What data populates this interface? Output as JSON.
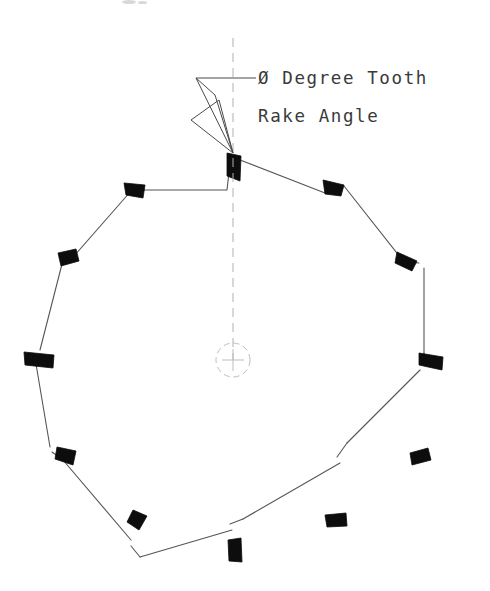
{
  "drawing": {
    "title": "Circular Saw Blade Tooth Rake Angle",
    "background_color": "#ffffff",
    "ink_color": "#1a1a1a",
    "line_color": "#555555",
    "centerline_color": "#b0b0b0",
    "tip_fill_color": "#0d0d0d",
    "annotation": {
      "line1": "Ø Degree Tooth",
      "line2": "Rake Angle",
      "line1_x": 258,
      "line1_y": 84,
      "line2_x": 258,
      "line2_y": 122,
      "text_color": "#3a3a3a"
    },
    "leader": {
      "name": "rake-angle-leader",
      "horizontal_start_x": 196,
      "horizontal_end_x": 256,
      "horizontal_y": 78,
      "arrow_tip_x": 233,
      "arrow_tip_y": 153,
      "triangle_upper": "196,78 233,153 215,95",
      "triangle_lower": "191,120 233,153 219,100"
    },
    "centerline": {
      "name": "vertical-centerline",
      "x": 233,
      "y_top": 38,
      "y_bottom": 360,
      "dash_pattern": "9 6",
      "width": 1
    },
    "hub": {
      "name": "arbor-center-mark",
      "cx": 233,
      "cy": 360,
      "radius": 17,
      "cross_len": 11,
      "dash_pattern": "6 4"
    },
    "blade": {
      "name": "saw-blade-outline",
      "tooth_count": 12,
      "body_path": "M 233,158 L 324,192 L 337,185 L 404,262 L 403,271 L 443,363 L 434,365 L 420,462 L 412,462 L 347,524 L 340,521 L 241,557 L 235,553 L 140,522 L 137,515 L 62,459 L 62,452 L 36,363 L 44,358 L 61,263 L 69,263 L 131,190 L 138,193 Z",
      "outline_segments": [
        {
          "name": "gullet-top",
          "d": "M 140,190 L 227,190 L 229,172"
        },
        {
          "name": "back-slope-1",
          "d": "M 240,160 L 325,193"
        },
        {
          "name": "gullet-1",
          "d": "M 325,193 L 337,186"
        },
        {
          "name": "back-slope-2",
          "d": "M 344,186 L 404,262"
        },
        {
          "name": "gullet-2",
          "d": "M 404,262 L 419,263"
        },
        {
          "name": "back-slope-3",
          "d": "M 424,268 L 424,353"
        },
        {
          "name": "gullet-3",
          "d": "M 424,353 L 424,362"
        },
        {
          "name": "back-slope-4",
          "d": "M 420,370 L 347,443"
        },
        {
          "name": "gullet-4",
          "d": "M 347,443 L 337,457"
        },
        {
          "name": "back-slope-5",
          "d": "M 340,463 L 243,519"
        },
        {
          "name": "gullet-5",
          "d": "M 243,519 L 230,524"
        },
        {
          "name": "back-slope-6",
          "d": "M 232,530 L 140,557"
        },
        {
          "name": "gullet-6",
          "d": "M 140,557 L 131,546"
        },
        {
          "name": "back-slope-7",
          "d": "M 131,540 L 63,460"
        },
        {
          "name": "gullet-7",
          "d": "M 63,460 L 52,452"
        },
        {
          "name": "back-slope-8",
          "d": "M 50,447 L 36,364"
        },
        {
          "name": "gullet-8",
          "d": "M 36,364 L 36,355"
        },
        {
          "name": "back-slope-9",
          "d": "M 40,350 L 62,264"
        },
        {
          "name": "gullet-9",
          "d": "M 62,264 L 70,257"
        },
        {
          "name": "back-slope-10",
          "d": "M 74,256 L 131,191"
        }
      ],
      "teeth": [
        {
          "index": 1,
          "name": "tooth-carbide-tip",
          "position": "top",
          "points": "227,153 241,156 240,181 227,176",
          "tip_x": 233,
          "tip_y": 155
        },
        {
          "index": 2,
          "name": "tooth-carbide-tip",
          "position": "upper-right-1",
          "points": "323,180 344,185 341,196 325,194",
          "tip_x": 333,
          "tip_y": 186
        },
        {
          "index": 3,
          "name": "tooth-carbide-tip",
          "position": "upper-right-2",
          "points": "397,252 417,261 412,271 395,263",
          "tip_x": 406,
          "tip_y": 261
        },
        {
          "index": 4,
          "name": "tooth-carbide-tip",
          "position": "right",
          "points": "419,353 443,357 442,370 419,365",
          "tip_x": 431,
          "tip_y": 361
        },
        {
          "index": 5,
          "name": "tooth-carbide-tip",
          "position": "lower-right-1",
          "points": "410,453 428,448 431,460 412,465",
          "tip_x": 420,
          "tip_y": 456
        },
        {
          "index": 6,
          "name": "tooth-carbide-tip",
          "position": "lower-right-2",
          "points": "325,515 346,513 347,526 327,527",
          "tip_x": 336,
          "tip_y": 520
        },
        {
          "index": 7,
          "name": "tooth-carbide-tip",
          "position": "bottom",
          "points": "228,540 241,538 242,562 229,561",
          "tip_x": 235,
          "tip_y": 550
        },
        {
          "index": 8,
          "name": "tooth-carbide-tip",
          "position": "lower-left-1",
          "points": "133,510 147,516 139,530 127,522",
          "tip_x": 137,
          "tip_y": 520
        },
        {
          "index": 9,
          "name": "tooth-carbide-tip",
          "position": "lower-left-2",
          "points": "57,447 76,451 73,465 55,459",
          "tip_x": 65,
          "tip_y": 456
        },
        {
          "index": 10,
          "name": "tooth-carbide-tip",
          "position": "left",
          "points": "24,352 54,355 53,368 25,365",
          "tip_x": 39,
          "tip_y": 360
        },
        {
          "index": 11,
          "name": "tooth-carbide-tip",
          "position": "upper-left-1",
          "points": "58,253 76,249 79,261 61,266",
          "tip_x": 68,
          "tip_y": 257
        },
        {
          "index": 12,
          "name": "tooth-carbide-tip",
          "position": "upper-left-2",
          "points": "124,183 145,185 143,198 126,195",
          "tip_x": 134,
          "tip_y": 190
        }
      ]
    },
    "scan_artifacts": [
      {
        "name": "scan-speck",
        "x": 122,
        "y": 0,
        "w": 14,
        "h": 4
      },
      {
        "name": "scan-speck",
        "x": 138,
        "y": 1,
        "w": 9,
        "h": 3
      }
    ]
  }
}
